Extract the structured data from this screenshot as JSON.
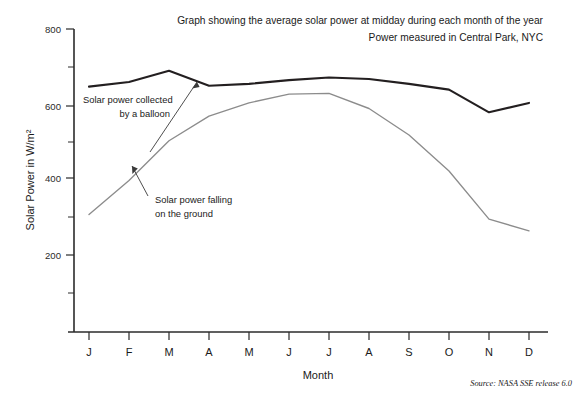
{
  "chart_data": {
    "type": "line",
    "title": "Graph showing the average solar power at midday during each month of the year",
    "subtitle": "Power measured in Central Park, NYC",
    "xlabel": "Month",
    "ylabel": "Solar Power in W/m²",
    "categories": [
      "J",
      "F",
      "M",
      "A",
      "M",
      "J",
      "J",
      "A",
      "S",
      "O",
      "N",
      "D"
    ],
    "ylim": [
      0,
      800
    ],
    "yticks": [
      200,
      400,
      600,
      800
    ],
    "ytick_labels": [
      "200",
      "400",
      "600",
      "800"
    ],
    "yminor_ticks": [
      100,
      300,
      500,
      700
    ],
    "grid": false,
    "legend": "none",
    "series": [
      {
        "name": "Solar power collected by a balloon",
        "color": "#231f20",
        "values": [
          648,
          660,
          690,
          650,
          655,
          665,
          672,
          668,
          655,
          640,
          580,
          605
        ]
      },
      {
        "name": "Solar power falling on the ground",
        "color": "#8c8c8c",
        "values": [
          310,
          400,
          505,
          570,
          605,
          628,
          630,
          590,
          520,
          425,
          298,
          267
        ]
      }
    ],
    "annotations": [
      {
        "id": "balloon-annotation",
        "line1": "Solar power collected",
        "line2": "by a balloon",
        "target_month": "A",
        "target_value": 652
      },
      {
        "id": "ground-annotation",
        "line1": "Solar power falling",
        "line2": "on the ground",
        "target_month": "M",
        "target_value": 432
      }
    ],
    "source": "Source: NASA SSE release 6.0"
  }
}
